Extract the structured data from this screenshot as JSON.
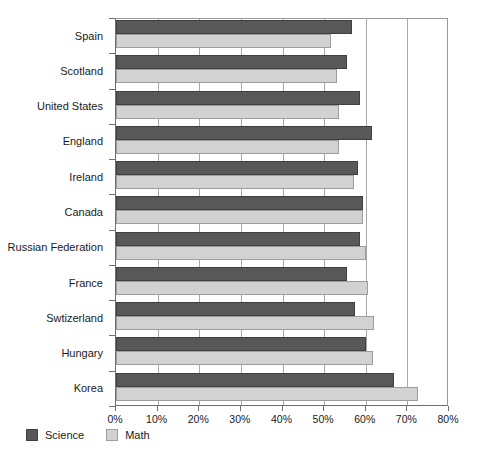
{
  "chart_data": {
    "type": "bar",
    "orientation": "horizontal",
    "title": "",
    "xlabel": "",
    "ylabel": "",
    "xlim": [
      0,
      80
    ],
    "xticks": [
      "0%",
      "10%",
      "20%",
      "30%",
      "40%",
      "50%",
      "60%",
      "70%",
      "80%"
    ],
    "xtick_values": [
      0,
      10,
      20,
      30,
      40,
      50,
      60,
      70,
      80
    ],
    "grid": "vertical",
    "legend_position": "bottom-left",
    "categories": [
      "Spain",
      "Scotland",
      "United States",
      "England",
      "Ireland",
      "Canada",
      "Russian Federation",
      "France",
      "Swtizerland",
      "Hungary",
      "Korea"
    ],
    "series": [
      {
        "name": "Science",
        "color": "#585858",
        "values": [
          56.8,
          55.5,
          58.6,
          61.5,
          58.1,
          59.4,
          58.6,
          55.5,
          57.4,
          60.1,
          66.8
        ]
      },
      {
        "name": "Math",
        "color": "#d2d2d2",
        "values": [
          51.7,
          53.1,
          53.6,
          53.6,
          57.2,
          59.4,
          60.1,
          60.6,
          62.0,
          61.8,
          72.6
        ]
      }
    ]
  },
  "legend": {
    "items": [
      {
        "label": "Science",
        "swatch": "science-swatch"
      },
      {
        "label": "Math",
        "swatch": "math-swatch"
      }
    ]
  }
}
